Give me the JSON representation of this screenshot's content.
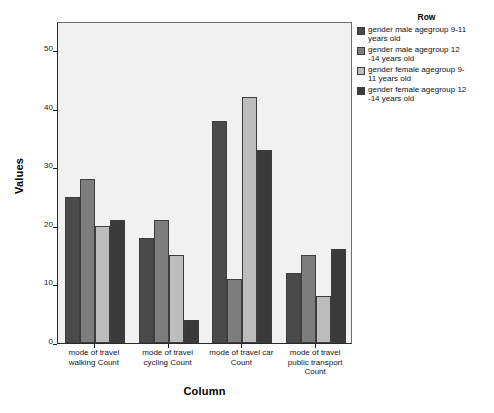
{
  "chart_data": {
    "type": "bar",
    "title": "",
    "xlabel": "Column",
    "ylabel": "Values",
    "ylim": [
      0,
      55
    ],
    "yticks": [
      0,
      10,
      20,
      30,
      40,
      50
    ],
    "grid": false,
    "legend_position": "right",
    "legend_title": "Row",
    "categories": [
      "mode of travel walking Count",
      "mode of travel cycling Count",
      "mode of travel car Count",
      "mode of travel public transport Count"
    ],
    "category_lines": [
      [
        "mode of travel",
        "walking Count"
      ],
      [
        "mode of travel",
        "cycling Count"
      ],
      [
        "mode of travel car",
        "Count"
      ],
      [
        "mode of travel",
        "public transport",
        "Count"
      ]
    ],
    "series": [
      {
        "name": "gender male agegroup 9-11 years old",
        "name_lines": [
          "gender male agegroup 9-11",
          "years old"
        ],
        "color": "#4a4a4a",
        "values": [
          25,
          18,
          38,
          12
        ]
      },
      {
        "name": "gender male agegroup 12 -14 years old",
        "name_lines": [
          "gender male agegroup 12",
          "-14 years old"
        ],
        "color": "#7d7d7d",
        "values": [
          28,
          21,
          11,
          15
        ]
      },
      {
        "name": "gender female agegroup 9-11 years old",
        "name_lines": [
          "gender female agegroup 9-",
          "11 years old"
        ],
        "color": "#bcbcbc",
        "values": [
          20,
          15,
          42,
          8
        ]
      },
      {
        "name": "gender female agegroup 12 -14 years old",
        "name_lines": [
          "gender female agegroup 12",
          "-14 years old"
        ],
        "color": "#3a3a3a",
        "values": [
          21,
          4,
          33,
          16
        ]
      }
    ],
    "plot_background": "#f1f1f1",
    "axis_color": "#2a2a2a",
    "bar_border_color": "#3d3d3d"
  }
}
